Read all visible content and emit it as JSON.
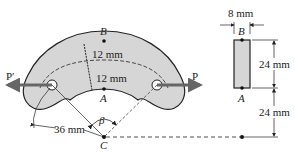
{
  "figure": {
    "points": {
      "A": "A",
      "B": "B",
      "C": "C"
    },
    "loads": {
      "left": "P′",
      "right": "P"
    },
    "angle": "β",
    "dims": {
      "thick_outer": "12 mm",
      "thick_inner": "12 mm",
      "inner_radius": "36 mm",
      "section_width": "8 mm",
      "section_height": "24 mm",
      "section_offset": "24 mm"
    },
    "section_labels": {
      "top": "B",
      "bottom": "A"
    }
  }
}
